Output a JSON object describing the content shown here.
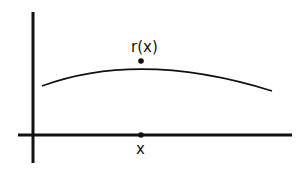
{
  "diagram": {
    "labels": {
      "curve_point": "r(x)",
      "axis_point": "x"
    },
    "colors": {
      "stroke": "#111111",
      "background": "#ffffff"
    }
  }
}
